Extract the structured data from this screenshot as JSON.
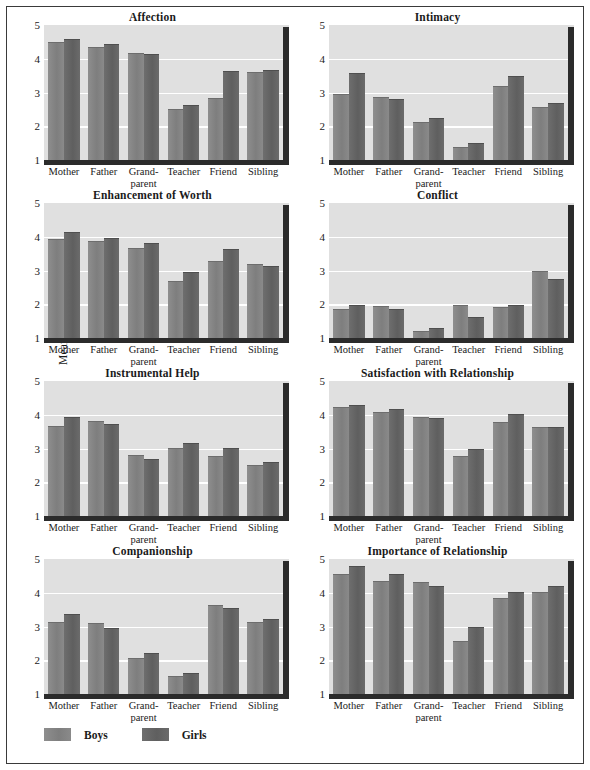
{
  "figure": {
    "ylabel": "Mean rating",
    "yticks": [
      "5",
      "4",
      "3",
      "2",
      "1"
    ],
    "ylim": [
      1,
      5
    ],
    "categories": [
      "Mother",
      "Father",
      "Grand-parent",
      "Teacher",
      "Friend",
      "Sibling"
    ],
    "category_lines": [
      [
        "Mother"
      ],
      [
        "Father"
      ],
      [
        "Grand-",
        "parent"
      ],
      [
        "Teacher"
      ],
      [
        "Friend"
      ],
      [
        "Sibling"
      ]
    ],
    "legend": [
      {
        "label": "Boys",
        "color": "#828282"
      },
      {
        "label": "Girls",
        "color": "#626262"
      }
    ],
    "panel_bg": "#e0e0e0",
    "gridline_color": "#ffffff",
    "shadow_color": "#2b2b2b"
  },
  "chart_data": [
    {
      "type": "bar",
      "title": "Affection",
      "xlabel": "",
      "ylabel": "Mean rating",
      "ylim": [
        1,
        5
      ],
      "grid": true,
      "legend": "bottom",
      "categories": [
        "Mother",
        "Father",
        "Grand-parent",
        "Teacher",
        "Friend",
        "Sibling"
      ],
      "series": [
        {
          "name": "Boys",
          "values": [
            4.5,
            4.35,
            4.18,
            2.5,
            2.85,
            3.62
          ]
        },
        {
          "name": "Girls",
          "values": [
            4.6,
            4.45,
            4.13,
            2.62,
            3.65,
            3.68
          ]
        }
      ]
    },
    {
      "type": "bar",
      "title": "Intimacy",
      "xlabel": "",
      "ylabel": "Mean rating",
      "ylim": [
        1,
        5
      ],
      "grid": true,
      "legend": "bottom",
      "categories": [
        "Mother",
        "Father",
        "Grand-parent",
        "Teacher",
        "Friend",
        "Sibling"
      ],
      "series": [
        {
          "name": "Boys",
          "values": [
            2.95,
            2.88,
            2.13,
            1.4,
            3.2,
            2.58
          ]
        },
        {
          "name": "Girls",
          "values": [
            3.57,
            2.8,
            2.25,
            1.5,
            3.48,
            2.68
          ]
        }
      ]
    },
    {
      "type": "bar",
      "title": "Enhancement of Worth",
      "xlabel": "",
      "ylabel": "Mean rating",
      "ylim": [
        1,
        5
      ],
      "grid": true,
      "legend": "bottom",
      "categories": [
        "Mother",
        "Father",
        "Grand-parent",
        "Teacher",
        "Friend",
        "Sibling"
      ],
      "series": [
        {
          "name": "Boys",
          "values": [
            3.92,
            3.88,
            3.68,
            2.68,
            3.28,
            3.2
          ]
        },
        {
          "name": "Girls",
          "values": [
            4.15,
            3.97,
            3.82,
            2.95,
            3.63,
            3.13
          ]
        }
      ]
    },
    {
      "type": "bar",
      "title": "Conflict",
      "xlabel": "",
      "ylabel": "Mean rating",
      "ylim": [
        1,
        5
      ],
      "grid": true,
      "legend": "bottom",
      "categories": [
        "Mother",
        "Father",
        "Grand-parent",
        "Teacher",
        "Friend",
        "Sibling"
      ],
      "series": [
        {
          "name": "Boys",
          "values": [
            1.85,
            1.95,
            1.22,
            1.98,
            1.93,
            2.98
          ]
        },
        {
          "name": "Girls",
          "values": [
            1.97,
            1.87,
            1.3,
            1.62,
            1.97,
            2.75
          ]
        }
      ]
    },
    {
      "type": "bar",
      "title": "Instrumental Help",
      "xlabel": "",
      "ylabel": "Mean rating",
      "ylim": [
        1,
        5
      ],
      "grid": true,
      "legend": "bottom",
      "categories": [
        "Mother",
        "Father",
        "Grand-parent",
        "Teacher",
        "Friend",
        "Sibling"
      ],
      "series": [
        {
          "name": "Boys",
          "values": [
            3.68,
            3.82,
            2.82,
            3.03,
            2.77,
            2.5
          ]
        },
        {
          "name": "Girls",
          "values": [
            3.93,
            3.73,
            2.7,
            3.17,
            3.03,
            2.6
          ]
        }
      ]
    },
    {
      "type": "bar",
      "title": "Satisfaction with Relationship",
      "xlabel": "",
      "ylabel": "Mean rating",
      "ylim": [
        1,
        5
      ],
      "grid": true,
      "legend": "bottom",
      "categories": [
        "Mother",
        "Father",
        "Grand-parent",
        "Teacher",
        "Friend",
        "Sibling"
      ],
      "series": [
        {
          "name": "Boys",
          "values": [
            4.22,
            4.08,
            3.93,
            2.78,
            3.8,
            3.65
          ]
        },
        {
          "name": "Girls",
          "values": [
            4.3,
            4.17,
            3.9,
            3.0,
            4.03,
            3.65
          ]
        }
      ]
    },
    {
      "type": "bar",
      "title": "Companionship",
      "xlabel": "",
      "ylabel": "Mean rating",
      "ylim": [
        1,
        5
      ],
      "grid": true,
      "legend": "bottom",
      "categories": [
        "Mother",
        "Father",
        "Grand-parent",
        "Teacher",
        "Friend",
        "Sibling"
      ],
      "series": [
        {
          "name": "Boys",
          "values": [
            3.13,
            3.1,
            2.07,
            1.52,
            3.63,
            3.13
          ]
        },
        {
          "name": "Girls",
          "values": [
            3.38,
            2.95,
            2.22,
            1.62,
            3.55,
            3.22
          ]
        }
      ]
    },
    {
      "type": "bar",
      "title": "Importance of Relationship",
      "xlabel": "",
      "ylabel": "Mean rating",
      "ylim": [
        1,
        5
      ],
      "grid": true,
      "legend": "bottom",
      "categories": [
        "Mother",
        "Father",
        "Grand-parent",
        "Teacher",
        "Friend",
        "Sibling"
      ],
      "series": [
        {
          "name": "Boys",
          "values": [
            4.57,
            4.35,
            4.33,
            2.57,
            3.85,
            4.03
          ]
        },
        {
          "name": "Girls",
          "values": [
            4.8,
            4.57,
            4.2,
            2.98,
            4.03,
            4.2
          ]
        }
      ]
    }
  ]
}
